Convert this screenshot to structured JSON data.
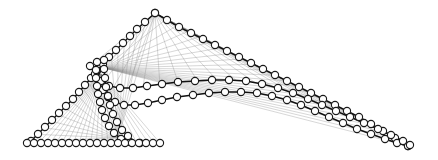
{
  "figure": {
    "background_color": "#ffffff",
    "width": 438,
    "height": 160,
    "node_fill": "#ffffff",
    "node_stroke": "#1a1a1a",
    "node_radius": 3.6,
    "node_stroke_width": 1.15,
    "fiber_color": "#8c8c8c",
    "fiber_width": 0.45,
    "fiber_opacity": 0.78,
    "chain_stroke": "#111111",
    "chain_stroke_width": 1.5
  },
  "chart_data": {
    "type": "scatter",
    "xlabel": "",
    "ylabel": "",
    "xlim": [
      0,
      438
    ],
    "ylim": [
      0,
      160
    ],
    "grid": false,
    "legend": null,
    "series": [
      {
        "name": "upper-left-ascending-chain",
        "marker": "circle-open",
        "values": [
          [
            31,
            141
          ],
          [
            38,
            134
          ],
          [
            45,
            127
          ],
          [
            52,
            120
          ],
          [
            59,
            113
          ],
          [
            66,
            106
          ],
          [
            73,
            99
          ],
          [
            79,
            92
          ],
          [
            85,
            85
          ],
          [
            91,
            78
          ],
          [
            97,
            71
          ],
          [
            103,
            64
          ],
          [
            109,
            57
          ],
          [
            116,
            50
          ],
          [
            123,
            43
          ],
          [
            130,
            36
          ],
          [
            137,
            29
          ],
          [
            145,
            22
          ],
          [
            155,
            13
          ]
        ]
      },
      {
        "name": "upper-right-descending-chain",
        "marker": "circle-open",
        "values": [
          [
            155,
            13
          ],
          [
            167,
            20
          ],
          [
            179,
            27
          ],
          [
            191,
            33
          ],
          [
            203,
            39
          ],
          [
            215,
            45
          ],
          [
            227,
            51
          ],
          [
            239,
            57
          ],
          [
            251,
            63
          ],
          [
            263,
            69
          ],
          [
            275,
            75
          ],
          [
            287,
            81
          ],
          [
            299,
            87
          ],
          [
            311,
            93
          ],
          [
            323,
            99
          ],
          [
            335,
            105
          ],
          [
            347,
            111
          ],
          [
            359,
            117
          ],
          [
            371,
            124
          ],
          [
            383,
            131
          ],
          [
            395,
            138
          ],
          [
            408,
            146
          ]
        ]
      },
      {
        "name": "inner-lower-caustic-chain",
        "marker": "circle-open",
        "values": [
          [
            96,
            73
          ],
          [
            99,
            82
          ],
          [
            103,
            90
          ],
          [
            108,
            97
          ],
          [
            115,
            102
          ],
          [
            124,
            105
          ],
          [
            135,
            105
          ],
          [
            148,
            103
          ],
          [
            162,
            100
          ],
          [
            177,
            97
          ],
          [
            193,
            95
          ],
          [
            209,
            93
          ],
          [
            225,
            92
          ],
          [
            241,
            92
          ],
          [
            257,
            93
          ],
          [
            272,
            96
          ],
          [
            287,
            100
          ],
          [
            301,
            105
          ],
          [
            315,
            111
          ],
          [
            329,
            117
          ],
          [
            343,
            123
          ],
          [
            357,
            129
          ],
          [
            371,
            134
          ],
          [
            385,
            139
          ],
          [
            397,
            143
          ],
          [
            408,
            146
          ]
        ]
      },
      {
        "name": "inner-upper-caustic-chain",
        "marker": "circle-open",
        "values": [
          [
            90,
            66
          ],
          [
            95,
            74
          ],
          [
            101,
            81
          ],
          [
            109,
            86
          ],
          [
            120,
            88
          ],
          [
            133,
            88
          ],
          [
            147,
            86
          ],
          [
            162,
            84
          ],
          [
            178,
            82
          ],
          [
            195,
            81
          ],
          [
            212,
            80
          ],
          [
            229,
            80
          ],
          [
            246,
            81
          ],
          [
            262,
            84
          ],
          [
            278,
            88
          ],
          [
            293,
            93
          ],
          [
            308,
            99
          ],
          [
            322,
            105
          ],
          [
            336,
            111
          ],
          [
            350,
            117
          ],
          [
            364,
            123
          ],
          [
            378,
            129
          ],
          [
            391,
            135
          ],
          [
            403,
            141
          ],
          [
            410,
            145
          ]
        ]
      },
      {
        "name": "cusp-descending-fold-chain",
        "marker": "circle-open",
        "values": [
          [
            97,
            62
          ],
          [
            96,
            70
          ],
          [
            96,
            78
          ],
          [
            97,
            86
          ],
          [
            98,
            94
          ],
          [
            100,
            102
          ],
          [
            102,
            110
          ],
          [
            105,
            118
          ],
          [
            109,
            126
          ],
          [
            114,
            133
          ],
          [
            121,
            139
          ],
          [
            130,
            142
          ],
          [
            140,
            143
          ]
        ]
      },
      {
        "name": "cusp-inner-fold-chain",
        "marker": "circle-open",
        "values": [
          [
            104,
            60
          ],
          [
            104,
            69
          ],
          [
            105,
            78
          ],
          [
            106,
            87
          ],
          [
            108,
            96
          ],
          [
            110,
            105
          ],
          [
            113,
            114
          ],
          [
            117,
            122
          ],
          [
            122,
            130
          ],
          [
            128,
            136
          ]
        ]
      },
      {
        "name": "bottom-horizontal-chain",
        "marker": "circle-open",
        "values": [
          [
            27,
            143
          ],
          [
            34,
            143
          ],
          [
            41,
            143
          ],
          [
            48,
            143
          ],
          [
            55,
            143
          ],
          [
            62,
            143
          ],
          [
            69,
            143
          ],
          [
            76,
            143
          ],
          [
            83,
            143
          ],
          [
            90,
            143
          ],
          [
            97,
            143
          ],
          [
            104,
            143
          ],
          [
            111,
            143
          ],
          [
            118,
            143
          ],
          [
            125,
            143
          ],
          [
            132,
            143
          ],
          [
            139,
            143
          ],
          [
            146,
            143
          ],
          [
            153,
            143
          ],
          [
            160,
            143
          ]
        ]
      }
    ],
    "fiber_bundles": [
      {
        "name": "apex-to-cusp-fan",
        "from": [
          155,
          13
        ],
        "to_chain": "inner-upper-caustic-chain",
        "count": 22
      },
      {
        "name": "cusp-to-bottom-fan",
        "from": [
          101,
          74
        ],
        "to_chain": "bottom-horizontal-chain",
        "count": 24
      },
      {
        "name": "left-chain-to-bottom-fan",
        "from_chain": "upper-left-ascending-chain",
        "to": [
          118,
          138
        ],
        "count": 20
      },
      {
        "name": "upper-right-to-inner-fan",
        "from_chain": "upper-right-descending-chain",
        "to": [
          104,
          68
        ],
        "count": 24
      }
    ]
  }
}
